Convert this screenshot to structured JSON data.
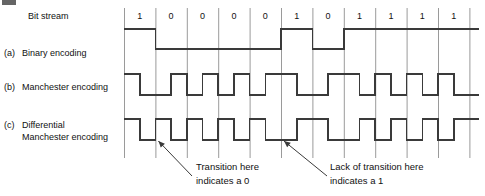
{
  "figure": {
    "stroke_color": "#3a3a3a",
    "grid_color": "#9a9a9a",
    "text_color": "#111111"
  },
  "row_labels": {
    "bit_stream": "Bit stream",
    "a_tag": "(a)",
    "a_label": "Binary encoding",
    "b_tag": "(b)",
    "b_label": "Manchester encoding",
    "c_tag": "(c)",
    "c_label_line1": "Differential",
    "c_label_line2": "Manchester encoding"
  },
  "chart_data": {
    "type": "line",
    "xlabel": "Bit stream",
    "ylabel": "Signal level",
    "grid": true,
    "legend": "none",
    "bits": [
      "1",
      "0",
      "0",
      "0",
      "0",
      "1",
      "0",
      "1",
      "1",
      "1",
      "1"
    ],
    "bit_count": 11,
    "series": [
      {
        "name": "Binary encoding",
        "levels": [
          "high",
          "low",
          "low",
          "low",
          "low",
          "high",
          "low",
          "high",
          "high",
          "high",
          "high"
        ],
        "description": "NRZ: level held high for a 1 and low for a 0 for the whole bit period"
      },
      {
        "name": "Manchester encoding",
        "halves": [
          [
            "high",
            "low"
          ],
          [
            "low",
            "high"
          ],
          [
            "low",
            "high"
          ],
          [
            "low",
            "high"
          ],
          [
            "low",
            "high"
          ],
          [
            "high",
            "low"
          ],
          [
            "low",
            "high"
          ],
          [
            "high",
            "low"
          ],
          [
            "high",
            "low"
          ],
          [
            "high",
            "low"
          ],
          [
            "high",
            "low"
          ]
        ],
        "description": "1 = high-to-low mid-bit transition, 0 = low-to-high mid-bit transition"
      },
      {
        "name": "Differential Manchester encoding",
        "halves": [
          [
            "high",
            "low"
          ],
          [
            "high",
            "low"
          ],
          [
            "high",
            "low"
          ],
          [
            "high",
            "low"
          ],
          [
            "high",
            "low"
          ],
          [
            "low",
            "high"
          ],
          [
            "high",
            "low"
          ],
          [
            "low",
            "high"
          ],
          [
            "low",
            "high"
          ],
          [
            "low",
            "high"
          ],
          [
            "low",
            "high"
          ]
        ],
        "description": "Always a mid-bit transition; an extra transition at the start of the bit period indicates a 0, absence of one indicates a 1"
      }
    ]
  },
  "annotations": [
    {
      "id": "transition-note",
      "line1": "Transition here",
      "line2": "indicates a 0",
      "points_at_bit_index": 1
    },
    {
      "id": "lack-of-transition-note",
      "line1": "Lack of transition here",
      "line2": "indicates a 1",
      "points_at_bit_index": 5
    }
  ]
}
